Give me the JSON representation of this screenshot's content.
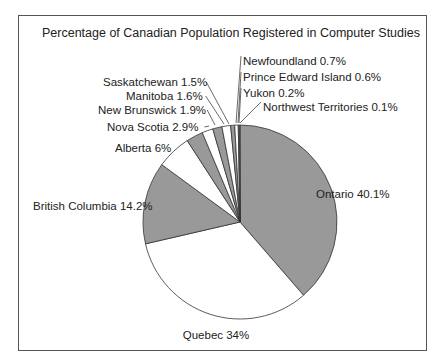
{
  "chart_data": {
    "type": "pie",
    "title": "Percentage of Canadian Population Registered in Computer Studies",
    "categories": [
      "Ontario",
      "Quebec",
      "British Columbia",
      "Alberta",
      "Nova Scotia",
      "New Brunswick",
      "Manitoba",
      "Saskatchewan",
      "Newfoundland",
      "Prince Edward Island",
      "Yukon",
      "Northwest Territories"
    ],
    "values": [
      40.1,
      34,
      14.2,
      6,
      2.9,
      1.9,
      1.6,
      1.5,
      0.7,
      0.6,
      0.2,
      0.1
    ],
    "labels": [
      "Ontario 40.1%",
      "Quebec 34%",
      "British Columbia 14.2%",
      "Alberta 6%",
      "Nova Scotia 2.9%",
      "New Brunswick 1.9%",
      "Manitoba 1.6%",
      "Saskatchewan 1.5%",
      "Newfoundland 0.7%",
      "Prince Edward Island 0.6%",
      "Yukon 0.2%",
      "Northwest Territories 0.1%"
    ],
    "fills": [
      "#999999",
      "#ffffff",
      "#999999",
      "#ffffff",
      "#999999",
      "#ffffff",
      "#999999",
      "#ffffff",
      "#999999",
      "#ffffff",
      "#999999",
      "#ffffff"
    ],
    "legend": "none (direct labels)"
  }
}
